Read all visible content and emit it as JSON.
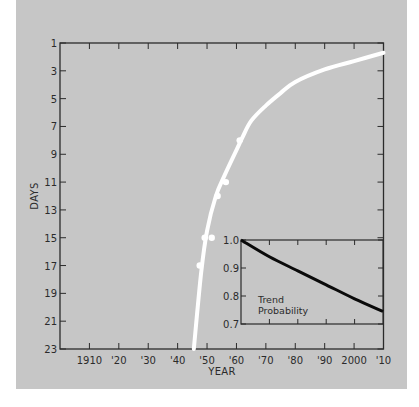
{
  "chart_data": [
    {
      "type": "scatter",
      "title": "",
      "xlabel": "YEAR",
      "ylabel": "DAYS",
      "x_ticks": [
        "1910",
        "'20",
        "'30",
        "'40",
        "'50",
        "'60",
        "'70",
        "'80",
        "'90",
        "2000",
        "'10"
      ],
      "y_ticks": [
        "1",
        "3",
        "5",
        "7",
        "9",
        "11",
        "13",
        "15",
        "17",
        "19",
        "21",
        "23"
      ],
      "xlim": [
        1900,
        2010
      ],
      "ylim": [
        23,
        1
      ],
      "y_inverted": true,
      "grid": false,
      "series": [
        {
          "name": "observations",
          "kind": "points",
          "x": [
            1947.5,
            1949.2,
            1951.6,
            1953.6,
            1956.4,
            1961.1
          ],
          "y": [
            17,
            15,
            15,
            12,
            11,
            8
          ]
        },
        {
          "name": "fitted trend",
          "kind": "line",
          "x": [
            1945.5,
            1948,
            1950,
            1953,
            1956,
            1960,
            1962,
            1965,
            1970,
            1975,
            1980,
            1990,
            2000,
            2010
          ],
          "y": [
            23,
            17.5,
            14.5,
            12,
            10.5,
            8.7,
            7.8,
            6.6,
            5.5,
            4.6,
            3.8,
            2.9,
            2.3,
            1.7
          ]
        }
      ]
    },
    {
      "type": "line",
      "title": "Trend Probability",
      "xlabel": "",
      "ylabel": "",
      "y_ticks": [
        "1.0",
        "0.9",
        "0.8",
        "0.7"
      ],
      "xlim": [
        1960,
        2010
      ],
      "ylim": [
        0.7,
        1.0
      ],
      "grid": false,
      "series": [
        {
          "name": "Trend Probability",
          "x": [
            1960,
            1970,
            1980,
            1990,
            2000,
            2010
          ],
          "y": [
            1.0,
            0.94,
            0.89,
            0.84,
            0.79,
            0.745
          ]
        }
      ]
    }
  ],
  "main": {
    "ylabel": "DAYS",
    "xlabel": "YEAR",
    "y_ticks": [
      "1",
      "3",
      "5",
      "7",
      "9",
      "11",
      "13",
      "15",
      "17",
      "19",
      "21",
      "23"
    ],
    "x_ticks": [
      "1910",
      "'20",
      "'30",
      "'40",
      "'50",
      "'60",
      "'70",
      "'80",
      "'90",
      "2000",
      "'10"
    ]
  },
  "inset": {
    "label_line1": "Trend",
    "label_line2": "Probability",
    "y_ticks": [
      "1.0",
      "0.9",
      "0.8",
      "0.7"
    ]
  },
  "colors": {
    "background": "#c6c6c6",
    "axis": "#2b2b2b",
    "curve": "#ffffff",
    "inset_curve": "#0a0a0a"
  }
}
